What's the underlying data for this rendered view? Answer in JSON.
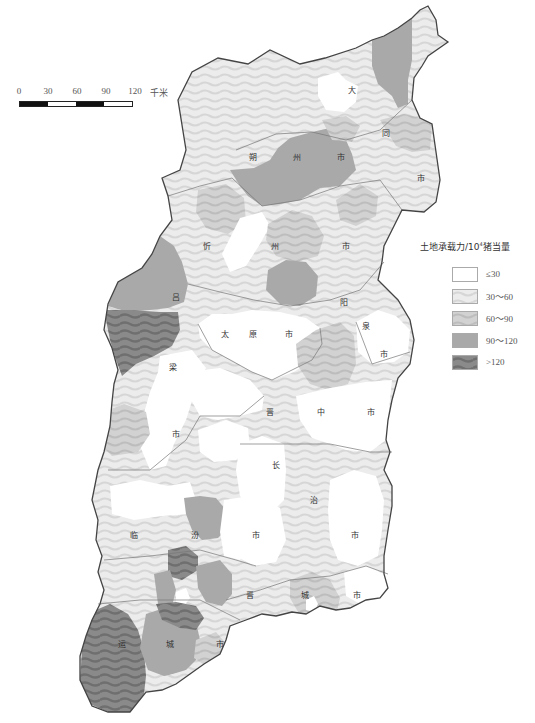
{
  "scale_bar": {
    "ticks": [
      "0",
      "30",
      "60",
      "90",
      "120"
    ],
    "unit": "千米",
    "segment_colors": [
      "#111111",
      "#ffffff",
      "#111111",
      "#ffffff"
    ]
  },
  "legend": {
    "title_prefix": "土地承载力/10",
    "title_sup": "4",
    "title_suffix": "猪当量",
    "items": [
      {
        "label": "≤30",
        "color": "#ffffff"
      },
      {
        "label": "30～60",
        "color": "#e6e6e6"
      },
      {
        "label": "60～90",
        "color": "#cfcfcf"
      },
      {
        "label": "90～120",
        "color": "#a9a9a9"
      },
      {
        "label": ">120",
        "color": "#808080"
      }
    ]
  },
  "map": {
    "title": "山西省土地承载力分布",
    "outline_color": "#444444",
    "city_labels": [
      {
        "chars": [
          "大",
          "同",
          "市"
        ],
        "positions": [
          [
            352,
            90
          ],
          [
            386,
            133
          ],
          [
            421,
            178
          ]
        ]
      },
      {
        "chars": [
          "朔",
          "州",
          "市"
        ],
        "positions": [
          [
            253,
            157
          ],
          [
            297,
            157
          ],
          [
            341,
            157
          ]
        ]
      },
      {
        "chars": [
          "忻",
          "州",
          "市"
        ],
        "positions": [
          [
            207,
            246
          ],
          [
            275,
            246
          ],
          [
            346,
            246
          ]
        ]
      },
      {
        "chars": [
          "吕",
          "梁",
          "市"
        ],
        "positions": [
          [
            176,
            297
          ],
          [
            173,
            367
          ],
          [
            176,
            434
          ]
        ]
      },
      {
        "chars": [
          "太",
          "原",
          "市"
        ],
        "positions": [
          [
            225,
            334
          ],
          [
            253,
            334
          ],
          [
            289,
            334
          ]
        ]
      },
      {
        "chars": [
          "阳",
          "泉",
          "市"
        ],
        "positions": [
          [
            344,
            302
          ],
          [
            366,
            326
          ],
          [
            384,
            354
          ]
        ]
      },
      {
        "chars": [
          "晋",
          "中",
          "市"
        ],
        "positions": [
          [
            270,
            412
          ],
          [
            321,
            412
          ],
          [
            371,
            412
          ]
        ]
      },
      {
        "chars": [
          "长",
          "治",
          "市"
        ],
        "positions": [
          [
            276,
            465
          ],
          [
            314,
            500
          ],
          [
            355,
            535
          ]
        ]
      },
      {
        "chars": [
          "临",
          "汾",
          "市"
        ],
        "positions": [
          [
            134,
            535
          ],
          [
            195,
            535
          ],
          [
            256,
            535
          ]
        ]
      },
      {
        "chars": [
          "晋",
          "城",
          "市"
        ],
        "positions": [
          [
            250,
            595
          ],
          [
            305,
            595
          ],
          [
            357,
            595
          ]
        ]
      },
      {
        "chars": [
          "运",
          "城",
          "市"
        ],
        "positions": [
          [
            122,
            644
          ],
          [
            170,
            644
          ],
          [
            220,
            644
          ]
        ]
      }
    ]
  }
}
